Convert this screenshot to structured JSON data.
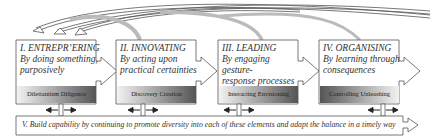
{
  "diagram": {
    "stages": [
      {
        "title": "I. ENTREPR’ERING",
        "subtitle_line1": "By doing something,",
        "subtitle_line2": "purposively",
        "bar_label": "Dilettantism Diligence",
        "bar_gradient": "light-to-dark"
      },
      {
        "title": "II. INNOVATING",
        "subtitle_line1": "By acting upon",
        "subtitle_line2": "practical certainties",
        "bar_label": "Discovery   Creation",
        "bar_gradient": "light-to-dark"
      },
      {
        "title": "III. LEADING",
        "subtitle_line1": "By engaging gesture-",
        "subtitle_line2": "response processes",
        "bar_label": "Interacting Envisioning",
        "bar_gradient": "light-to-dark"
      },
      {
        "title": "IV. ORGANISING",
        "subtitle_line1": "By learning through",
        "subtitle_line2": "consequences",
        "bar_label": "Controlling Unleashing",
        "bar_gradient": "dark-to-light"
      }
    ],
    "foundation": {
      "text": "V. Build capability by continuing to promote diversity into each of these elements and adapt the balance in a timely way"
    },
    "feedback_arrows": [
      {
        "from": "II. INNOVATING",
        "to": "I. ENTREPR’ERING"
      },
      {
        "from": "III. LEADING",
        "to": "I. ENTREPR’ERING"
      },
      {
        "from": "IV. ORGANISING",
        "to": "I. ENTREPR’ERING"
      }
    ],
    "colors": {
      "border": "#555555",
      "bar_dark": "#5a5a5a",
      "bar_light": "#f0f0f0",
      "arrow_band": "#bdbdbd"
    }
  }
}
